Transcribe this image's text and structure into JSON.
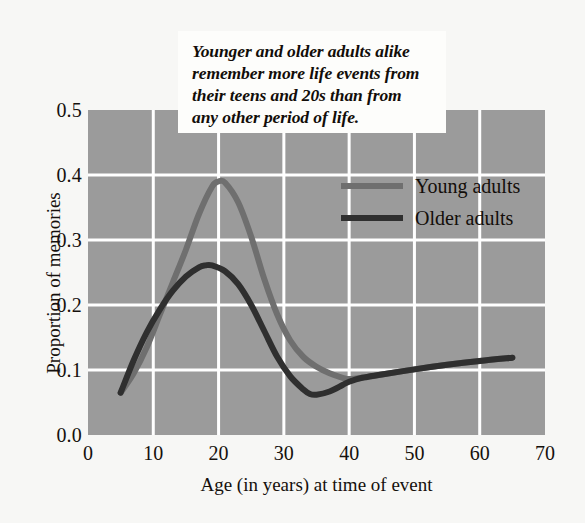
{
  "callout": {
    "text": "Younger and older adults alike\nremember more life events from\ntheir teens and 20s than from\nany other period of life."
  },
  "legend": {
    "items": [
      {
        "label": "Young adults",
        "color": "#6f6f6f"
      },
      {
        "label": "Older adults",
        "color": "#2f2f2f"
      }
    ]
  },
  "bottom_caption": "",
  "colors": {
    "plot_background": "#9b9b9b",
    "page_background": "#f7f7f5",
    "grid": "#ffffff",
    "callout_background": "#fdfdfb",
    "text": "#15100c",
    "young_adults": "#6f6f6f",
    "older_adults": "#2f2f2f"
  },
  "chart_data": {
    "type": "line",
    "title": "",
    "xlabel": "Age (in years) at time of event",
    "ylabel": "Proportion of memories",
    "xlim": [
      0,
      70
    ],
    "ylim": [
      0.0,
      0.5
    ],
    "xticks": [
      0,
      10,
      20,
      30,
      40,
      50,
      60,
      70
    ],
    "yticks": [
      0.0,
      0.1,
      0.2,
      0.3,
      0.4,
      0.5
    ],
    "xtick_labels": [
      "0",
      "10",
      "20",
      "30",
      "40",
      "50",
      "60",
      "70"
    ],
    "ytick_labels": [
      "0.0",
      "0.1",
      "0.2",
      "0.3",
      "0.4",
      "0.5"
    ],
    "grid": true,
    "grid_color": "#ffffff",
    "legend_position": "upper right",
    "annotations": [
      "Younger and older adults alike remember more life events from their teens and 20s than from any other period of life."
    ],
    "series": [
      {
        "name": "Young adults",
        "color": "#6f6f6f",
        "x": [
          5,
          7,
          9,
          11,
          13,
          15,
          17,
          19,
          20,
          21,
          23,
          25,
          27,
          29,
          31,
          33,
          35,
          37,
          39,
          40,
          42,
          45,
          50,
          55,
          60,
          65
        ],
        "y": [
          0.065,
          0.095,
          0.135,
          0.185,
          0.235,
          0.285,
          0.34,
          0.382,
          0.39,
          0.388,
          0.358,
          0.305,
          0.24,
          0.185,
          0.145,
          0.12,
          0.105,
          0.095,
          0.088,
          0.086,
          0.088,
          0.093,
          0.101,
          0.108,
          0.114,
          0.119
        ]
      },
      {
        "name": "Older adults",
        "color": "#2f2f2f",
        "x": [
          5,
          7,
          9,
          11,
          13,
          15,
          17,
          18,
          19,
          21,
          23,
          25,
          27,
          29,
          31,
          33,
          34,
          35,
          37,
          39,
          40,
          42,
          45,
          50,
          55,
          60,
          65
        ],
        "y": [
          0.065,
          0.115,
          0.158,
          0.193,
          0.222,
          0.244,
          0.258,
          0.261,
          0.261,
          0.252,
          0.232,
          0.2,
          0.16,
          0.12,
          0.09,
          0.07,
          0.063,
          0.062,
          0.067,
          0.077,
          0.082,
          0.088,
          0.093,
          0.101,
          0.108,
          0.114,
          0.119
        ]
      }
    ]
  }
}
